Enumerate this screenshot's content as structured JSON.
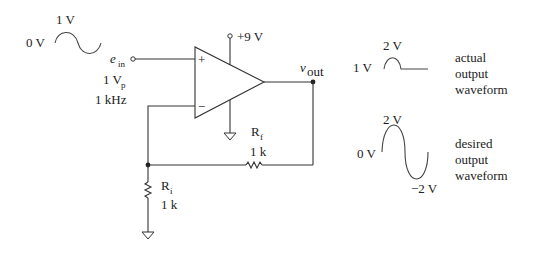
{
  "input_waveform": {
    "peak_label": "1 V",
    "baseline_label": "0 V"
  },
  "input_terminal": {
    "name_main": "e",
    "name_sub": "in",
    "amplitude_main": "1 V",
    "amplitude_sub": "p",
    "frequency": "1 kHz"
  },
  "op_amp": {
    "supply_label": "+9 V",
    "noninverting_symbol": "+",
    "inverting_symbol": "−"
  },
  "output": {
    "name_main": "v",
    "name_sub": "out"
  },
  "feedback_resistor": {
    "name_main": "R",
    "name_sub": "f",
    "value": "1 k"
  },
  "input_resistor": {
    "name_main": "R",
    "name_sub": "i",
    "value": "1 k"
  },
  "actual_output": {
    "peak_label": "2 V",
    "baseline_label": "1 V",
    "caption": [
      "actual",
      "output",
      "waveform"
    ]
  },
  "desired_output": {
    "peak_label": "2 V",
    "baseline_label": "0 V",
    "trough_label": "−2 V",
    "caption": [
      "desired",
      "output",
      "waveform"
    ]
  }
}
